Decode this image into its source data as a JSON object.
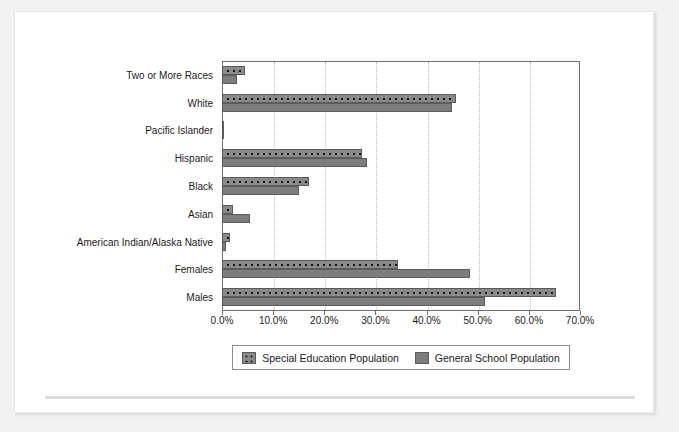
{
  "chart_data": {
    "type": "bar",
    "orientation": "horizontal",
    "title": "",
    "xlabel": "",
    "ylabel": "",
    "xlim": [
      0,
      70
    ],
    "xticks": [
      "0.0%",
      "10.0%",
      "20.0%",
      "30.0%",
      "40.0%",
      "50.0%",
      "60.0%",
      "70.0%"
    ],
    "xtick_values": [
      0,
      10,
      20,
      30,
      40,
      50,
      60,
      70
    ],
    "grid": true,
    "legend_position": "bottom",
    "categories": [
      "Two or More Races",
      "White",
      "Pacific Islander",
      "Hispanic",
      "Black",
      "Asian",
      "American Indian/Alaska Native",
      "Females",
      "Males"
    ],
    "series": [
      {
        "name": "Special Education Population",
        "pattern": "dotted",
        "color": "#8a8a8a",
        "values": [
          4.5,
          45.7,
          0.3,
          27.4,
          17.0,
          2.1,
          1.5,
          34.5,
          65.3
        ]
      },
      {
        "name": "General School Population",
        "pattern": "solid",
        "color": "#7d7d7d",
        "values": [
          3.0,
          45.0,
          0.4,
          28.4,
          15.1,
          5.5,
          0.8,
          48.5,
          51.4
        ]
      }
    ]
  },
  "legend": {
    "items": [
      {
        "label": "Special Education Population",
        "pattern": "special"
      },
      {
        "label": "General School Population",
        "pattern": "general"
      }
    ]
  }
}
